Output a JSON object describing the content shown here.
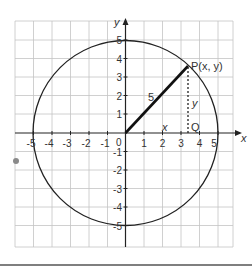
{
  "diagram": {
    "title": "",
    "type": "unit-circle-coordinate-diagram",
    "axes": {
      "x_label": "x",
      "y_label": "y",
      "x_ticks": [
        "-5",
        "-4",
        "-3",
        "-2",
        "-1",
        "1",
        "2",
        "3",
        "4",
        "5"
      ],
      "y_ticks": [
        "5",
        "4",
        "3",
        "2",
        "1",
        "-1",
        "-2",
        "-3",
        "-4",
        "-5"
      ],
      "origin_label": "0",
      "range": [
        -5.5,
        5.5
      ]
    },
    "circle": {
      "center": [
        0,
        0
      ],
      "radius": 5
    },
    "point_P": {
      "label": "P(x, y)",
      "coords": [
        3.4,
        3.6
      ]
    },
    "point_Q": {
      "label": "Q",
      "coords": [
        3.4,
        0
      ]
    },
    "radius_label": "5",
    "horizontal_label": "x",
    "vertical_label": "y",
    "colors": {
      "grid": "#bbbbbb",
      "axis": "#222222",
      "circle": "#222222",
      "radius": "#111111",
      "dot": "#888888"
    }
  }
}
